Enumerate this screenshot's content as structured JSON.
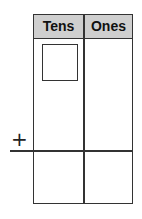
{
  "place_value_chart": {
    "columns": [
      "Tens",
      "Ones"
    ],
    "operator": "+",
    "answer_box": "empty"
  }
}
